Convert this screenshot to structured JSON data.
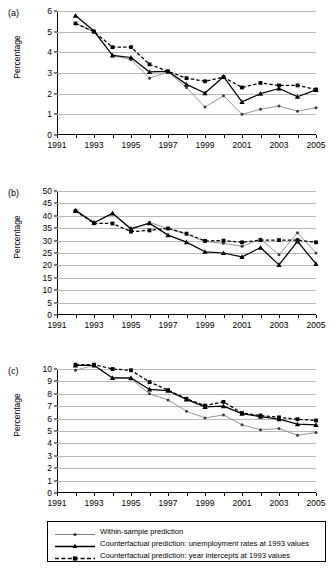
{
  "figure": {
    "ylabel": "Percentage",
    "panels": [
      {
        "tag": "(a)"
      },
      {
        "tag": "(b)"
      },
      {
        "tag": "(c)"
      }
    ]
  },
  "legend": {
    "items": [
      {
        "label": "Within-sample prediction",
        "key": "gray-dot-line",
        "color": "#808080"
      },
      {
        "label": "Counterfactual prediction: unemployment rates at 1993 values",
        "key": "black-triangle-solid-line",
        "color": "#000000"
      },
      {
        "label": "Counterfactual prediction: year intercepts at 1993 values",
        "key": "black-square-dashed-line",
        "color": "#000000"
      }
    ]
  },
  "chart_data": [
    {
      "type": "line",
      "panel": "(a)",
      "title": "",
      "xlabel": "",
      "ylabel": "Percentage",
      "xlim": [
        1991,
        2005
      ],
      "ylim": [
        0,
        6
      ],
      "yticks": [
        0,
        1,
        2,
        3,
        4,
        5,
        6
      ],
      "xticks": [
        1991,
        1992,
        1993,
        1994,
        1995,
        1996,
        1997,
        1998,
        1999,
        2000,
        2001,
        2002,
        2003,
        2004,
        2005
      ],
      "xticklabels": [
        "1991",
        "",
        "1993",
        "",
        "1995",
        "",
        "1997",
        "",
        "1999",
        "",
        "2001",
        "",
        "2003",
        "",
        "2005"
      ],
      "grid": "horizontal",
      "x": [
        1992,
        1993,
        1994,
        1995,
        1996,
        1997,
        1998,
        1999,
        2000,
        2001,
        2002,
        2003,
        2004,
        2005
      ],
      "series": [
        {
          "name": "Within-sample prediction",
          "values": [
            5.4,
            5.0,
            3.85,
            3.65,
            2.75,
            3.05,
            2.3,
            1.35,
            1.9,
            1.0,
            1.25,
            1.4,
            1.15,
            1.32
          ]
        },
        {
          "name": "Counterfactual prediction: unemployment rates at 1993 values",
          "values": [
            5.78,
            5.03,
            3.85,
            3.75,
            3.05,
            3.08,
            2.45,
            2.03,
            2.82,
            1.6,
            2.0,
            2.25,
            1.85,
            2.18
          ]
        },
        {
          "name": "Counterfactual prediction: year intercepts at 1993 values",
          "values": [
            5.4,
            5.0,
            4.25,
            4.25,
            3.42,
            3.08,
            2.75,
            2.6,
            2.8,
            2.3,
            2.52,
            2.4,
            2.4,
            2.2
          ]
        }
      ]
    },
    {
      "type": "line",
      "panel": "(b)",
      "title": "",
      "xlabel": "",
      "ylabel": "Percentage",
      "xlim": [
        1991,
        2005
      ],
      "ylim": [
        0,
        50
      ],
      "yticks": [
        0,
        5,
        10,
        15,
        20,
        25,
        30,
        35,
        40,
        45,
        50
      ],
      "xticks": [
        1991,
        1992,
        1993,
        1994,
        1995,
        1996,
        1997,
        1998,
        1999,
        2000,
        2001,
        2002,
        2003,
        2004,
        2005
      ],
      "xticklabels": [
        "1991",
        "",
        "1993",
        "",
        "1995",
        "",
        "1997",
        "",
        "1999",
        "",
        "2001",
        "",
        "2003",
        "",
        "2005"
      ],
      "grid": "horizontal",
      "x": [
        1992,
        1993,
        1994,
        1995,
        1996,
        1997,
        1998,
        1999,
        2000,
        2001,
        2002,
        2003,
        2004,
        2005
      ],
      "series": [
        {
          "name": "Within-sample prediction",
          "values": [
            41.8,
            37.2,
            41.0,
            34.3,
            37.4,
            34.8,
            32.6,
            29.6,
            28.9,
            27.7,
            30.6,
            24.3,
            33.2,
            25.0
          ]
        },
        {
          "name": "Counterfactual prediction: unemployment rates at 1993 values",
          "values": [
            42.2,
            37.2,
            41.0,
            34.8,
            37.0,
            32.2,
            29.4,
            25.5,
            25.0,
            23.4,
            27.2,
            20.2,
            29.7,
            20.6
          ]
        },
        {
          "name": "Counterfactual prediction: year intercepts at 1993 values",
          "values": [
            41.9,
            37.0,
            36.9,
            33.6,
            34.1,
            34.9,
            32.8,
            29.9,
            30.0,
            29.3,
            30.2,
            30.2,
            30.2,
            29.3
          ]
        }
      ]
    },
    {
      "type": "line",
      "panel": "(c)",
      "title": "",
      "xlabel": "",
      "ylabel": "Percentage",
      "xlim": [
        1991,
        2005
      ],
      "ylim": [
        0,
        10
      ],
      "yticks": [
        0,
        1,
        2,
        3,
        4,
        5,
        6,
        7,
        8,
        9,
        10
      ],
      "xticks": [
        1991,
        1992,
        1993,
        1994,
        1995,
        1996,
        1997,
        1998,
        1999,
        2000,
        2001,
        2002,
        2003,
        2004,
        2005
      ],
      "xticklabels": [
        "1991",
        "",
        "1993",
        "",
        "1995",
        "",
        "1997",
        "",
        "1999",
        "",
        "2001",
        "",
        "2003",
        "",
        "2005"
      ],
      "grid": "horizontal",
      "x": [
        1992,
        1993,
        1994,
        1995,
        1996,
        1997,
        1998,
        1999,
        2000,
        2001,
        2002,
        2003,
        2004,
        2005
      ],
      "series": [
        {
          "name": "Within-sample prediction",
          "values": [
            9.9,
            10.3,
            9.28,
            9.2,
            8.0,
            7.5,
            6.6,
            6.05,
            6.3,
            5.5,
            5.1,
            5.2,
            4.65,
            4.88
          ]
        },
        {
          "name": "Counterfactual prediction: unemployment rates at 1993 values",
          "values": [
            10.3,
            10.3,
            9.28,
            9.28,
            8.35,
            8.25,
            7.55,
            6.95,
            7.0,
            6.4,
            6.15,
            5.95,
            5.55,
            5.5
          ]
        },
        {
          "name": "Counterfactual prediction: year intercepts at 1993 values",
          "values": [
            10.35,
            10.35,
            10.0,
            9.9,
            8.95,
            8.3,
            7.6,
            7.05,
            7.35,
            6.45,
            6.25,
            6.1,
            5.95,
            5.85
          ]
        }
      ]
    }
  ]
}
